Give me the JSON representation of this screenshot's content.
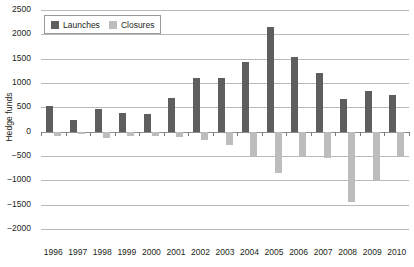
{
  "chart_data": {
    "type": "bar",
    "title": "",
    "subtitle": "",
    "xlabel": "",
    "ylabel": "Hedge funds",
    "ylim": [
      -2000,
      2500
    ],
    "ytick_step": 500,
    "grid": true,
    "legend_position": "top-left",
    "orientation": "vertical",
    "categories": [
      "1996",
      "1997",
      "1998",
      "1999",
      "2000",
      "2001",
      "2002",
      "2003",
      "2004",
      "2005",
      "2006",
      "2007",
      "2008",
      "2009",
      "2010"
    ],
    "ytick_labels": [
      "2500",
      "2000",
      "1500",
      "1000",
      "500",
      "0",
      "−500",
      "−1000",
      "−1500",
      "−2000"
    ],
    "ytick_values": [
      2500,
      2000,
      1500,
      1000,
      500,
      0,
      -500,
      -1000,
      -1500,
      -2000
    ],
    "series": [
      {
        "name": "Launches",
        "color": "#5e5e5e",
        "values": [
          530,
          230,
          470,
          380,
          370,
          700,
          1100,
          1100,
          1430,
          2150,
          1530,
          1200,
          670,
          830,
          760
        ]
      },
      {
        "name": "Closures",
        "color": "#bdbdbd",
        "values": [
          -80,
          -50,
          -130,
          -80,
          -80,
          -100,
          -180,
          -280,
          -500,
          -850,
          -530,
          -550,
          -1450,
          -1020,
          -530
        ]
      }
    ]
  },
  "legend": {
    "items": [
      {
        "label": "Launches",
        "color": "#5e5e5e"
      },
      {
        "label": "Closures",
        "color": "#bdbdbd"
      }
    ]
  },
  "axes": {
    "y_title": "Hedge funds"
  }
}
